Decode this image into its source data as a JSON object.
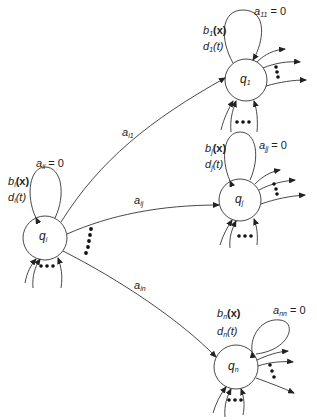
{
  "diagram": {
    "type": "state-transition-graph",
    "nodes": [
      {
        "id": "q1",
        "label_base": "q",
        "label_sub": "1",
        "cx": 246,
        "cy": 80,
        "r": 21,
        "self_loop": {
          "a_base": "a",
          "a_sub": "11",
          "a_value": "= 0"
        },
        "b_base": "b",
        "b_sub": "1",
        "b_arg": "(x)",
        "d_base": "d",
        "d_sub": "1",
        "d_arg": "(t)"
      },
      {
        "id": "qi",
        "label_base": "q",
        "label_sub": "i",
        "cx": 45,
        "cy": 238,
        "r": 22,
        "self_loop": {
          "a_base": "a",
          "a_sub": "ii",
          "a_value": "= 0"
        },
        "b_base": "b",
        "b_sub": "i",
        "b_arg": "(x)",
        "d_base": "d",
        "d_sub": "i",
        "d_arg": "(t)"
      },
      {
        "id": "qj",
        "label_base": "q",
        "label_sub": "j",
        "cx": 240,
        "cy": 200,
        "r": 21,
        "self_loop": {
          "a_base": "a",
          "a_sub": "jj",
          "a_value": "= 0"
        },
        "b_base": "b",
        "b_sub": "j",
        "b_arg": "(x)",
        "d_base": "d",
        "d_sub": "j",
        "d_arg": "(t)"
      },
      {
        "id": "qn",
        "label_base": "q",
        "label_sub": "n",
        "cx": 236,
        "cy": 367,
        "r": 22,
        "self_loop": {
          "a_base": "a",
          "a_sub": "nn",
          "a_value": "= 0"
        },
        "b_base": "b",
        "b_sub": "n",
        "b_arg": "(x)",
        "d_base": "d",
        "d_sub": "n",
        "d_arg": "(t)"
      }
    ],
    "edges": [
      {
        "from": "qi",
        "to": "q1",
        "label_base": "a",
        "label_sub": "i1"
      },
      {
        "from": "qi",
        "to": "qj",
        "label_base": "a",
        "label_sub": "ij"
      },
      {
        "from": "qi",
        "to": "qn",
        "label_base": "a",
        "label_sub": "in"
      }
    ],
    "ellipsis_symbol": "•••"
  }
}
